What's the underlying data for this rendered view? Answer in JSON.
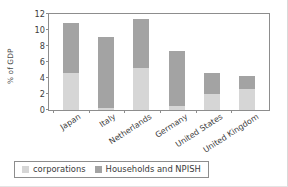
{
  "chart_data": {
    "type": "bar",
    "subtype": "stacked-vertical",
    "title": "",
    "xlabel": "",
    "ylabel": "% of GDP",
    "ylim": [
      0,
      12
    ],
    "yticks": [
      0,
      2,
      4,
      6,
      8,
      10,
      12
    ],
    "grid": false,
    "legend_position": "bottom-left",
    "categories": [
      "Japan",
      "Italy",
      "Netherlands",
      "Germany",
      "United States",
      "United Kingdom"
    ],
    "series": [
      {
        "name": "corporations",
        "color": "#d6d6d6",
        "values": [
          4.5,
          0.3,
          5.2,
          0.5,
          2.0,
          2.6
        ]
      },
      {
        "name": "Households and NPISH",
        "color": "#a3a3a3",
        "values": [
          6.1,
          8.6,
          6.0,
          6.7,
          2.5,
          1.6
        ]
      }
    ],
    "totals": [
      10.6,
      8.9,
      11.2,
      7.2,
      4.5,
      4.2
    ]
  },
  "legend": {
    "items": [
      {
        "label": "corporations",
        "color": "#d6d6d6"
      },
      {
        "label": "Households and NPISH",
        "color": "#a3a3a3"
      }
    ]
  },
  "colors": {
    "corporations": "#d6d6d6",
    "households": "#a3a3a3",
    "axis": "#8d8d8d",
    "text": "#3d3d3d",
    "background": "#ffffff"
  }
}
